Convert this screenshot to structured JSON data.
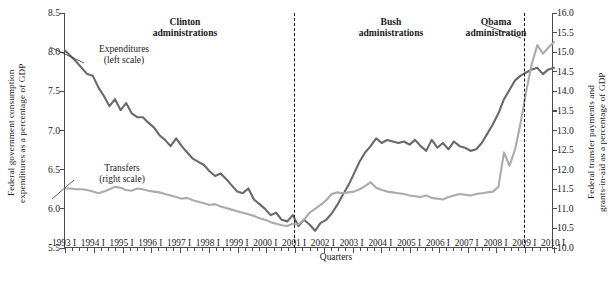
{
  "chart_data": {
    "type": "line",
    "title": "",
    "xlabel": "Quarters",
    "ylabel_left": "Federal government consumption\nexpenditures as a percentage of GDP",
    "ylabel_right": "Federal transfer payments and\ngrants-in-aid as a percentage of GDP",
    "grid": false,
    "legend_position": "inline-annotation",
    "ylim_left": [
      5.5,
      8.5
    ],
    "ylim_right": [
      10.0,
      16.0
    ],
    "yticks_left": [
      "8.5",
      "8.0",
      "7.5",
      "7.0",
      "6.5",
      "6.0",
      "5.5"
    ],
    "yticks_right": [
      "16.0",
      "15.5",
      "15.0",
      "14.5",
      "14.0",
      "13.5",
      "13.0",
      "12.5",
      "12.0",
      "11.5",
      "11.0",
      "10.5",
      "10.0"
    ],
    "xticks": [
      "1993 I",
      "1994 I",
      "1995 I",
      "1996 I",
      "1997 I",
      "1998 I",
      "1999 I",
      "2000 I",
      "2001 I",
      "2002 I",
      "2003 I",
      "2004 I",
      "2005 I",
      "2006 I",
      "2007 I",
      "2008 I",
      "2009 I",
      "2010 I"
    ],
    "x_minor_per_major": 4,
    "annotations": [
      {
        "name": "expenditures-label",
        "text": "Expenditures\n(left scale)"
      },
      {
        "name": "transfers-label",
        "text": "Transfers\n(right scale)"
      },
      {
        "name": "clinton-label",
        "text": "Clinton\nadministrations"
      },
      {
        "name": "bush-label",
        "text": "Bush\nadministrations"
      },
      {
        "name": "obama-label",
        "text": "Obama\nadministration"
      }
    ],
    "dividers": [
      {
        "name": "divider-2001",
        "at": "2001 I"
      },
      {
        "name": "divider-2009",
        "at": "2009 I"
      }
    ],
    "colors": {
      "expenditures": "#696969",
      "transfers": "#ababab",
      "axis": "#4a4a4a",
      "divider": "#111111"
    },
    "series": [
      {
        "name": "Expenditures (left scale)",
        "scale": "left",
        "color": "#696969",
        "values": [
          8.02,
          7.95,
          7.88,
          7.8,
          7.72,
          7.7,
          7.55,
          7.44,
          7.31,
          7.4,
          7.26,
          7.35,
          7.22,
          7.17,
          7.17,
          7.1,
          7.04,
          6.94,
          6.88,
          6.8,
          6.9,
          6.8,
          6.72,
          6.64,
          6.6,
          6.56,
          6.48,
          6.42,
          6.45,
          6.38,
          6.3,
          6.22,
          6.2,
          6.26,
          6.12,
          6.06,
          6.0,
          5.92,
          5.95,
          5.86,
          5.84,
          5.92,
          5.78,
          5.86,
          5.8,
          5.72,
          5.82,
          5.86,
          5.94,
          6.05,
          6.18,
          6.3,
          6.45,
          6.6,
          6.72,
          6.8,
          6.9,
          6.84,
          6.88,
          6.86,
          6.84,
          6.86,
          6.82,
          6.88,
          6.8,
          6.74,
          6.88,
          6.78,
          6.84,
          6.76,
          6.86,
          6.8,
          6.78,
          6.74,
          6.76,
          6.84,
          6.96,
          7.08,
          7.22,
          7.4,
          7.52,
          7.64,
          7.7,
          7.74,
          7.78,
          7.8,
          7.72,
          7.78,
          7.8
        ]
      },
      {
        "name": "Transfers (right scale)",
        "scale": "right",
        "color": "#ababab",
        "values": [
          11.52,
          11.52,
          11.5,
          11.5,
          11.48,
          11.44,
          11.4,
          11.44,
          11.5,
          11.56,
          11.54,
          11.48,
          11.46,
          11.52,
          11.5,
          11.46,
          11.44,
          11.42,
          11.38,
          11.34,
          11.3,
          11.26,
          11.28,
          11.22,
          11.18,
          11.14,
          11.1,
          11.12,
          11.06,
          11.02,
          10.98,
          10.94,
          10.9,
          10.86,
          10.82,
          10.76,
          10.72,
          10.66,
          10.62,
          10.58,
          10.56,
          10.62,
          10.6,
          10.72,
          10.9,
          11.0,
          11.1,
          11.22,
          11.38,
          11.42,
          11.4,
          11.42,
          11.44,
          11.5,
          11.58,
          11.68,
          11.54,
          11.48,
          11.44,
          11.42,
          11.4,
          11.38,
          11.34,
          11.32,
          11.3,
          11.34,
          11.28,
          11.26,
          11.24,
          11.3,
          11.34,
          11.38,
          11.36,
          11.34,
          11.38,
          11.4,
          11.42,
          11.44,
          11.56,
          12.44,
          12.1,
          12.52,
          13.2,
          14.0,
          14.7,
          15.18,
          14.96,
          15.12,
          15.26
        ]
      }
    ]
  }
}
